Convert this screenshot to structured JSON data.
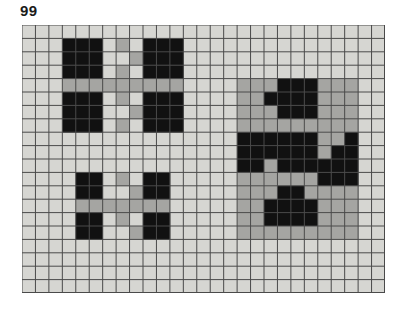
{
  "figure": {
    "label": "99",
    "caption_position": "top-left"
  },
  "grid": {
    "columns": 27,
    "rows": 20,
    "cell_width": 13.44,
    "cell_height": 13.4,
    "origin_x": 22,
    "origin_y": 25,
    "width": 363,
    "height": 268,
    "line_color": "#4a4a4a",
    "line_width": 1,
    "background_color": "#d6d6d2"
  },
  "colors": {
    "page_background": "#ffffff",
    "grid_background": "#d6d6d2",
    "grid_line": "#4a4a4a",
    "black_cell": "#111111",
    "gray_cell": "#a5a5a2",
    "label_text": "#1a1a1a"
  },
  "legend": {
    "black_label": "black cell",
    "gray_label": "gray cell",
    "empty_label": "empty cell"
  },
  "chart_data": {
    "type": "heatmap",
    "title": "99",
    "xlabel": "",
    "ylabel": "",
    "grid": true,
    "legend_position": "none",
    "ncols": 27,
    "nrows": 20,
    "value_map": {
      "0": "empty",
      "1": "gray",
      "2": "black"
    },
    "cells": [
      [
        0,
        0,
        0,
        0,
        0,
        0,
        0,
        0,
        0,
        0,
        0,
        0,
        0,
        0,
        0,
        0,
        0,
        0,
        0,
        0,
        0,
        0,
        0,
        0,
        0,
        0,
        0
      ],
      [
        0,
        0,
        0,
        2,
        2,
        2,
        0,
        1,
        0,
        2,
        2,
        2,
        0,
        0,
        0,
        0,
        0,
        0,
        0,
        0,
        0,
        0,
        0,
        0,
        0,
        0,
        0
      ],
      [
        0,
        0,
        0,
        2,
        2,
        2,
        0,
        0,
        1,
        2,
        2,
        2,
        0,
        0,
        0,
        0,
        0,
        0,
        0,
        0,
        0,
        0,
        0,
        0,
        0,
        0,
        0
      ],
      [
        0,
        0,
        0,
        2,
        2,
        2,
        0,
        1,
        0,
        2,
        2,
        2,
        0,
        0,
        0,
        0,
        0,
        0,
        0,
        0,
        0,
        0,
        0,
        0,
        0,
        0,
        0
      ],
      [
        0,
        0,
        0,
        1,
        1,
        1,
        1,
        1,
        1,
        1,
        1,
        1,
        0,
        0,
        0,
        0,
        1,
        1,
        1,
        2,
        2,
        2,
        1,
        1,
        1,
        0,
        0
      ],
      [
        0,
        0,
        0,
        2,
        2,
        2,
        0,
        1,
        0,
        2,
        2,
        2,
        0,
        0,
        0,
        0,
        1,
        1,
        2,
        2,
        2,
        2,
        1,
        1,
        1,
        0,
        0
      ],
      [
        0,
        0,
        0,
        2,
        2,
        2,
        0,
        0,
        1,
        2,
        2,
        2,
        0,
        0,
        0,
        0,
        1,
        1,
        1,
        2,
        2,
        2,
        1,
        1,
        1,
        0,
        0
      ],
      [
        0,
        0,
        0,
        2,
        2,
        2,
        0,
        1,
        0,
        2,
        2,
        2,
        0,
        0,
        0,
        0,
        1,
        1,
        1,
        1,
        1,
        1,
        1,
        1,
        1,
        0,
        0
      ],
      [
        0,
        0,
        0,
        0,
        0,
        0,
        0,
        0,
        0,
        0,
        0,
        0,
        0,
        0,
        0,
        0,
        2,
        2,
        2,
        2,
        2,
        2,
        1,
        1,
        2,
        0,
        0
      ],
      [
        0,
        0,
        0,
        0,
        0,
        0,
        0,
        0,
        0,
        0,
        0,
        0,
        0,
        0,
        0,
        0,
        2,
        2,
        2,
        2,
        2,
        2,
        1,
        2,
        2,
        0,
        0
      ],
      [
        0,
        0,
        0,
        0,
        0,
        0,
        0,
        0,
        0,
        0,
        0,
        0,
        0,
        0,
        0,
        0,
        2,
        2,
        1,
        2,
        2,
        2,
        2,
        2,
        2,
        0,
        0
      ],
      [
        0,
        0,
        0,
        0,
        2,
        2,
        0,
        1,
        0,
        2,
        2,
        0,
        0,
        0,
        0,
        0,
        1,
        1,
        1,
        1,
        1,
        1,
        2,
        2,
        2,
        0,
        0
      ],
      [
        0,
        0,
        0,
        0,
        2,
        2,
        0,
        0,
        1,
        2,
        2,
        0,
        0,
        0,
        0,
        0,
        1,
        1,
        1,
        2,
        2,
        1,
        1,
        1,
        1,
        0,
        0
      ],
      [
        0,
        0,
        0,
        0,
        1,
        1,
        1,
        1,
        1,
        1,
        1,
        0,
        0,
        0,
        0,
        0,
        1,
        1,
        2,
        2,
        2,
        2,
        1,
        1,
        1,
        0,
        0
      ],
      [
        0,
        0,
        0,
        0,
        2,
        2,
        0,
        1,
        0,
        2,
        2,
        0,
        0,
        0,
        0,
        0,
        1,
        1,
        2,
        2,
        2,
        2,
        1,
        1,
        1,
        0,
        0
      ],
      [
        0,
        0,
        0,
        0,
        2,
        2,
        0,
        0,
        1,
        2,
        2,
        0,
        0,
        0,
        0,
        0,
        1,
        1,
        1,
        1,
        1,
        1,
        1,
        1,
        1,
        0,
        0
      ],
      [
        0,
        0,
        0,
        0,
        0,
        0,
        0,
        0,
        0,
        0,
        0,
        0,
        0,
        0,
        0,
        0,
        0,
        0,
        0,
        0,
        0,
        0,
        0,
        0,
        0,
        0,
        0
      ],
      [
        0,
        0,
        0,
        0,
        0,
        0,
        0,
        0,
        0,
        0,
        0,
        0,
        0,
        0,
        0,
        0,
        0,
        0,
        0,
        0,
        0,
        0,
        0,
        0,
        0,
        0,
        0
      ],
      [
        0,
        0,
        0,
        0,
        0,
        0,
        0,
        0,
        0,
        0,
        0,
        0,
        0,
        0,
        0,
        0,
        0,
        0,
        0,
        0,
        0,
        0,
        0,
        0,
        0,
        0,
        0
      ],
      [
        0,
        0,
        0,
        0,
        0,
        0,
        0,
        0,
        0,
        0,
        0,
        0,
        0,
        0,
        0,
        0,
        0,
        0,
        0,
        0,
        0,
        0,
        0,
        0,
        0,
        0,
        0
      ]
    ],
    "shapes": [
      {
        "name": "top-left-cross-figure",
        "description": "Large plus arrangement: four 3x3 black squares joined by gray connector cells",
        "col_start": 3,
        "row_start": 1,
        "col_span": 9,
        "row_span": 7
      },
      {
        "name": "bottom-left-cross-figure",
        "description": "Small plus arrangement: four 2x2 black squares joined by gray connector cells",
        "col_start": 4,
        "row_start": 11,
        "col_span": 7,
        "row_span": 5
      },
      {
        "name": "right-composite-figure",
        "description": "Gray 9x12 panel containing black staircase shapes around a solid black core",
        "col_start": 16,
        "row_start": 4,
        "col_span": 9,
        "row_span": 12
      }
    ]
  }
}
